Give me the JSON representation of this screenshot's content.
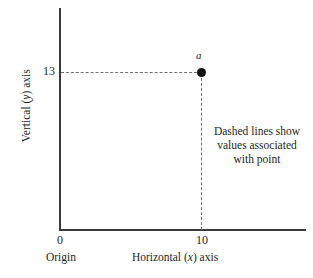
{
  "chart_data": {
    "type": "scatter",
    "title": "",
    "xlabel": "Horizontal (x) axis",
    "ylabel": "Vertical (y) axis",
    "grid": false,
    "legend": null,
    "x_ticks": [
      "0",
      "10"
    ],
    "y_ticks": [
      "13"
    ],
    "xlim": [
      0,
      16
    ],
    "ylim": [
      0,
      17
    ],
    "points": [
      {
        "label": "a",
        "x": 10,
        "y": 13
      }
    ],
    "series": [
      {
        "name": "a",
        "x": [
          10
        ],
        "values": [
          13
        ]
      }
    ],
    "annotations": [
      "Dashed lines show",
      "values associated",
      "with point"
    ],
    "origin_label": "Origin",
    "guides": [
      {
        "type": "dashed-horizontal",
        "from": "y-axis",
        "to": "point-a",
        "value": 13
      },
      {
        "type": "dashed-vertical",
        "from": "point-a",
        "to": "x-axis",
        "value": 10
      }
    ]
  },
  "axes": {
    "y": {
      "title_prefix": "Vertical (",
      "title_var": "y",
      "title_suffix": ") axis",
      "tick_13": "13"
    },
    "x": {
      "title_prefix": "Horizontal (",
      "title_var": "x",
      "title_suffix": ") axis",
      "tick_10": "10",
      "tick_0": "0"
    },
    "origin": {
      "label": "Origin"
    }
  },
  "point": {
    "label": "a"
  },
  "annotation": {
    "line1": "Dashed lines show",
    "line2": "values associated",
    "line3": "with point"
  },
  "colors": {
    "background": "#ffffff",
    "axis": "#3a3a3c",
    "dashed": "#6f6f72",
    "marker": "#111111",
    "text": "#231f20"
  }
}
